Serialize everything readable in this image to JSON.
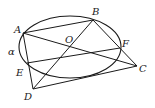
{
  "figure": {
    "type": "geometry",
    "ellipse": {
      "cx": 70,
      "cy": 47,
      "rx": 51,
      "ry": 31
    },
    "points": {
      "A": {
        "x": 23,
        "y": 33
      },
      "B": {
        "x": 93,
        "y": 20
      },
      "O": {
        "x": 70,
        "y": 47
      },
      "F": {
        "x": 120,
        "y": 48
      },
      "C": {
        "x": 137,
        "y": 66
      },
      "E": {
        "x": 27,
        "y": 63
      },
      "D": {
        "x": 33,
        "y": 89
      }
    },
    "segments": [
      [
        "A",
        "B"
      ],
      [
        "A",
        "C"
      ],
      [
        "A",
        "D"
      ],
      [
        "B",
        "C"
      ],
      [
        "B",
        "D"
      ],
      [
        "E",
        "F"
      ],
      [
        "D",
        "C"
      ]
    ],
    "labels": {
      "A": "A",
      "B": "B",
      "O": "O",
      "F": "F",
      "C": "C",
      "E": "E",
      "D": "D",
      "alpha": "α"
    },
    "stroke_color": "#1a1a1a"
  }
}
